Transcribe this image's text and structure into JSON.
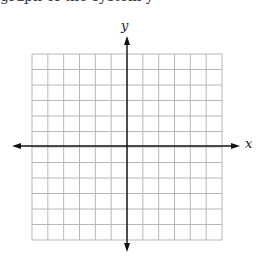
{
  "header": {
    "cut_off_text": "graph of the system y"
  },
  "graph": {
    "x_label": "x",
    "y_label": "y",
    "grid": {
      "columns": 12,
      "rows": 12,
      "left": 32,
      "top": 54,
      "right": 222,
      "bottom": 240,
      "line_color": "#b8b8b8"
    },
    "axis_color": "#111111",
    "x_axis": {
      "y": 146,
      "from": 12,
      "to": 240
    },
    "y_axis": {
      "x": 127,
      "from": 36,
      "to": 252
    }
  }
}
